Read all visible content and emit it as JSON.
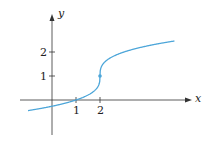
{
  "chart_data": {
    "type": "line",
    "title": "",
    "xlabel": "x",
    "ylabel": "y",
    "x_ticks": [
      "1",
      "2"
    ],
    "y_ticks": [
      "1",
      "2"
    ],
    "xlim": [
      -1,
      5
    ],
    "ylim": [
      -1.3,
      3.3
    ],
    "grid": false,
    "series": [
      {
        "name": "curve",
        "color": "#4da6d9",
        "x": [
          -1,
          0,
          1,
          1.5,
          2,
          2.5,
          3,
          4,
          5
        ],
        "y": [
          -0.44,
          -0.26,
          0,
          0.21,
          1,
          1.79,
          2,
          2.26,
          2.44
        ]
      }
    ],
    "highlight_point": {
      "x": 2,
      "y": 1
    }
  },
  "labels": {
    "x_axis": "x",
    "y_axis": "y",
    "xt1": "1",
    "xt2": "2",
    "yt1": "1",
    "yt2": "2"
  }
}
